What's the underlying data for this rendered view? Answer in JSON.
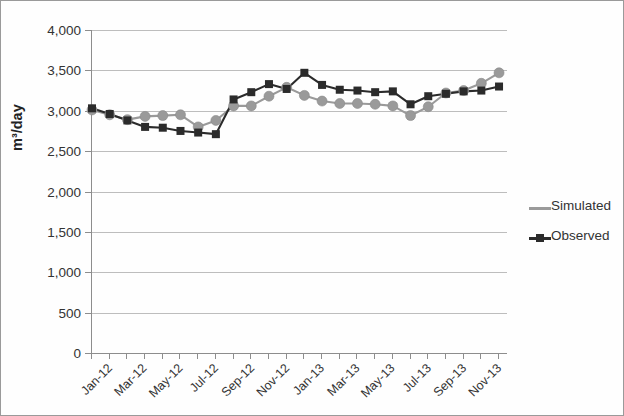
{
  "chart_data": {
    "type": "line",
    "title": "",
    "xlabel": "",
    "ylabel": "m³/day",
    "ylim": [
      0,
      4000
    ],
    "ytick_step": 500,
    "ytick_labels": [
      "4,000",
      "3,500",
      "3,000",
      "2,500",
      "2,000",
      "1,500",
      "1,000",
      "500",
      "0"
    ],
    "ytick_values": [
      4000,
      3500,
      3000,
      2500,
      2000,
      1500,
      1000,
      500,
      0
    ],
    "grid": true,
    "legend_position": "right",
    "x": [
      "Jan-12",
      "Feb-12",
      "Mar-12",
      "Apr-12",
      "May-12",
      "Jun-12",
      "Jul-12",
      "Aug-12",
      "Sep-12",
      "Oct-12",
      "Nov-12",
      "Dec-12",
      "Jan-13",
      "Feb-13",
      "Mar-13",
      "Apr-13",
      "May-13",
      "Jun-13",
      "Jul-13",
      "Aug-13",
      "Sep-13",
      "Oct-13",
      "Nov-13",
      "Dec-13"
    ],
    "xtick_labels": [
      "Jan-12",
      "Mar-12",
      "May-12",
      "Jul-12",
      "Sep-12",
      "Nov-12",
      "Jan-13",
      "Mar-13",
      "May-13",
      "Jul-13",
      "Sep-13",
      "Nov-13"
    ],
    "xtick_label_indices": [
      0,
      2,
      4,
      6,
      8,
      10,
      12,
      14,
      16,
      18,
      20,
      22
    ],
    "series": [
      {
        "name": "Simulated",
        "color": "#9a9a9a",
        "marker": "circle",
        "values": [
          3010,
          2950,
          2890,
          2930,
          2940,
          2950,
          2800,
          2880,
          3060,
          3060,
          3180,
          3290,
          3190,
          3120,
          3090,
          3090,
          3080,
          3060,
          2940,
          3050,
          3220,
          3250,
          3340,
          3470
        ]
      },
      {
        "name": "Observed",
        "color": "#2b2b2b",
        "marker": "square",
        "values": [
          3030,
          2960,
          2880,
          2800,
          2790,
          2750,
          2730,
          2710,
          3140,
          3230,
          3330,
          3270,
          3470,
          3320,
          3260,
          3250,
          3230,
          3240,
          3080,
          3180,
          3210,
          3240,
          3250,
          3300
        ]
      }
    ]
  },
  "legend": {
    "items": [
      {
        "label": "Simulated"
      },
      {
        "label": "Observed"
      }
    ]
  },
  "colors": {
    "simulated": "#9a9a9a",
    "observed": "#2b2b2b",
    "grid": "#bdbdbd",
    "axis": "#8d8d8d",
    "frame": "#9a9a9a"
  }
}
